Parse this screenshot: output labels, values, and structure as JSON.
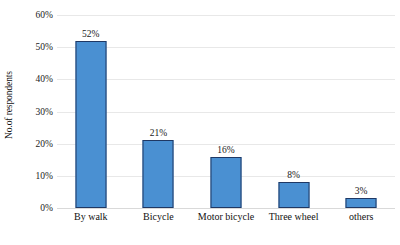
{
  "chart_data": {
    "type": "bar",
    "title": "",
    "xlabel": "",
    "ylabel": "No.of respondents",
    "categories": [
      "By walk",
      "Bicycle",
      "Motor bicycle",
      "Three wheel",
      "others"
    ],
    "values": [
      52,
      21,
      16,
      8,
      3
    ],
    "value_labels": [
      "52%",
      "21%",
      "16%",
      "8%",
      "3%"
    ],
    "ylim": [
      0,
      60
    ],
    "ytick_values": [
      0,
      10,
      20,
      30,
      40,
      50,
      60
    ],
    "ytick_labels": [
      "0%",
      "10%",
      "20%",
      "30%",
      "40%",
      "50%",
      "60%"
    ],
    "grid": true,
    "legend": false,
    "legend_position": "none",
    "series": [
      {
        "name": "No.of respondents",
        "values": [
          52,
          21,
          16,
          8,
          3
        ],
        "color": "#4a90d2",
        "border_color": "#1f3864"
      }
    ],
    "colors": {
      "bar_fill": "#4a90d2",
      "bar_border": "#1f3864",
      "gridline": "#e8e8e8",
      "baseline": "#d9d9d9",
      "background": "#ffffff",
      "text": "#1a1a1a"
    }
  }
}
